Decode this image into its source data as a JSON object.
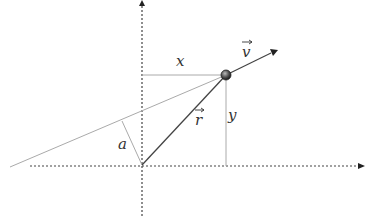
{
  "diagram": {
    "labels": {
      "x": "x",
      "y": "y",
      "r": "r",
      "v": "v",
      "a": "a"
    },
    "colors": {
      "axis": "#444444",
      "thin_line": "#aaaaaa",
      "vector": "#444444",
      "particle": "#555555",
      "label": "#333333"
    },
    "geometry": {
      "origin": [
        142,
        165
      ],
      "particle": [
        226,
        75
      ],
      "velocity_tip": [
        277,
        50
      ],
      "line_start": [
        10,
        167
      ],
      "perpendicular_foot": [
        122,
        121
      ],
      "x_axis_range": [
        30,
        364
      ],
      "y_axis_range": [
        2,
        218
      ]
    }
  }
}
